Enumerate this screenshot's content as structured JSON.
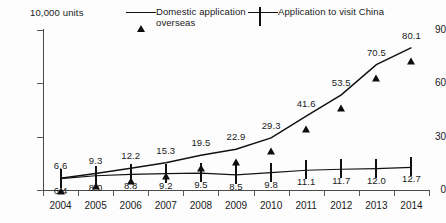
{
  "unit_caption": "10,000 units",
  "legend": {
    "position": "top",
    "entries": [
      {
        "label": "Domestic application overseas",
        "marker": "filled-triangle-marker",
        "color": "#0d0d0d"
      },
      {
        "label": "Application to visit China",
        "marker": "open-square-marker",
        "color": "#111111"
      }
    ]
  },
  "axes": {
    "y_ticks": [
      "0",
      "30",
      "60",
      "90"
    ],
    "x_labels": [
      "2004",
      "2005",
      "2006",
      "2007",
      "2008",
      "2009",
      "2010",
      "2011",
      "2012",
      "2013",
      "2014"
    ]
  },
  "chart_data": {
    "type": "line",
    "title": "",
    "subtitle": "",
    "xlabel": "",
    "ylabel": "10,000 units",
    "grid": false,
    "legend_position": "top",
    "ylim": [
      0,
      90
    ],
    "yticks": [
      0,
      30,
      60,
      90
    ],
    "categories": [
      "2004",
      "2005",
      "2006",
      "2007",
      "2008",
      "2009",
      "2010",
      "2011",
      "2012",
      "2013",
      "2014"
    ],
    "series": [
      {
        "name": "Domestic application overseas",
        "marker": "filled triangle",
        "label_position": "above",
        "values": [
          6.6,
          9.3,
          12.2,
          15.3,
          19.5,
          22.9,
          29.3,
          41.6,
          53.5,
          70.5,
          80.1
        ],
        "value_labels": [
          "6.6",
          "9.3",
          "12.2",
          "15.3",
          "19.5",
          "22.9",
          "29.3",
          "41.6",
          "53.5",
          "70.5",
          "80.1"
        ]
      },
      {
        "name": "Application to visit China",
        "marker": "open square",
        "label_position": "below",
        "values": [
          6.4,
          8.0,
          8.8,
          9.2,
          9.5,
          8.5,
          9.8,
          11.1,
          11.7,
          12.0,
          12.7
        ],
        "value_labels": [
          "6.4",
          "8.0",
          "8.8",
          "9.2",
          "9.5",
          "8.5",
          "9.8",
          "11.1",
          "11.7",
          "12.0",
          "12.7"
        ]
      }
    ]
  }
}
